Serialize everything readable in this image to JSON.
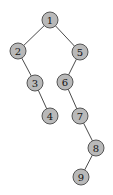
{
  "diagram": {
    "type": "binary-tree",
    "colors": {
      "node_fill": "#b9b9b9",
      "node_stroke": "#555555",
      "edge": "#4a4a4a",
      "label": "#111111"
    },
    "nodes": [
      {
        "id": "1",
        "label": "1",
        "x": 50,
        "y": 20
      },
      {
        "id": "2",
        "label": "2",
        "x": 18,
        "y": 51
      },
      {
        "id": "5",
        "label": "5",
        "x": 80,
        "y": 52
      },
      {
        "id": "3",
        "label": "3",
        "x": 35,
        "y": 83
      },
      {
        "id": "6",
        "label": "6",
        "x": 65,
        "y": 82
      },
      {
        "id": "4",
        "label": "4",
        "x": 50,
        "y": 116
      },
      {
        "id": "7",
        "label": "7",
        "x": 80,
        "y": 116
      },
      {
        "id": "8",
        "label": "8",
        "x": 96,
        "y": 148
      },
      {
        "id": "9",
        "label": "9",
        "x": 81,
        "y": 177
      }
    ],
    "edges": [
      {
        "from": "1",
        "to": "2"
      },
      {
        "from": "1",
        "to": "5"
      },
      {
        "from": "2",
        "to": "3"
      },
      {
        "from": "3",
        "to": "4"
      },
      {
        "from": "5",
        "to": "6"
      },
      {
        "from": "6",
        "to": "7"
      },
      {
        "from": "7",
        "to": "8"
      },
      {
        "from": "8",
        "to": "9"
      }
    ]
  }
}
